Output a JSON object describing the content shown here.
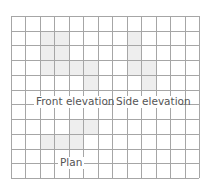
{
  "diagram": {
    "grid": {
      "x0": 11,
      "y0": 16,
      "cols": 13,
      "rows": 11,
      "cell_w": 14.46,
      "cell_h": 14.73,
      "line_color": "#a6a6a6",
      "background": "#ffffff"
    },
    "fill_color": "#eeeeee",
    "shapes": [
      {
        "name": "front-elevation-shape",
        "points": "41,31 70,31 70,61 98,61 98,91 84,91 84,76 41,76"
      },
      {
        "name": "side-elevation-shape",
        "points": "127,31 141,31 141,61 156,61 156,91 141,91 141,76 127,76"
      },
      {
        "name": "plan-shape",
        "points": "70,120 98,120 98,135 84,135 84,150 41,150 41,135 70,135"
      }
    ],
    "labels": [
      {
        "name": "front-elevation-label",
        "text": "Front elevation",
        "x": 36,
        "y": 105,
        "bg": [
          34,
          96,
          70,
          12
        ]
      },
      {
        "name": "side-elevation-label",
        "text": "Side elevation",
        "x": 116,
        "y": 105,
        "bg": [
          114,
          96,
          66,
          12
        ]
      },
      {
        "name": "plan-label",
        "text": "Plan",
        "x": 60,
        "y": 166,
        "bg": [
          58,
          157,
          26,
          12
        ]
      }
    ]
  }
}
